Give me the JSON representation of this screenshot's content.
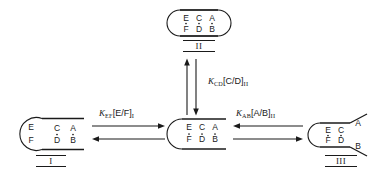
{
  "figure": {
    "type": "equilibrium-scheme",
    "background_color": "#ffffff",
    "line_color": "#1a1a1a"
  },
  "nodes": [
    {
      "id": "node-II",
      "numeral": "II",
      "left_end": "closed-round",
      "right_end": "closed-round",
      "rows": {
        "top": [
          "E",
          "C",
          "A"
        ],
        "bottom": [
          "F",
          "D",
          "B"
        ]
      },
      "pairs_bonded": [
        "E/F",
        "C/D",
        "A/B"
      ],
      "position": {
        "x": 168,
        "y": 8
      }
    },
    {
      "id": "node-center",
      "numeral": "",
      "left_end": "closed-round",
      "right_end": "open-flat",
      "rows": {
        "top": [
          "E",
          "C",
          "A"
        ],
        "bottom": [
          "F",
          "D",
          "B"
        ]
      },
      "pairs_bonded": [
        "E/F",
        "C/D",
        "A/B"
      ],
      "position": {
        "x": 168,
        "y": 117
      }
    },
    {
      "id": "node-I",
      "numeral": "I",
      "left_end": "open-bulb",
      "right_end": "open-flat",
      "rows": {
        "top": [
          "E",
          "C",
          "A"
        ],
        "bottom": [
          "F",
          "D",
          "B"
        ]
      },
      "pairs_bonded": [
        "C/D",
        "A/B"
      ],
      "position": {
        "x": 16,
        "y": 117
      }
    },
    {
      "id": "node-III",
      "numeral": "III",
      "left_end": "closed-round",
      "right_end": "splayed",
      "rows": {
        "top": [
          "E",
          "C",
          "A"
        ],
        "bottom": [
          "F",
          "D",
          "B"
        ]
      },
      "pairs_bonded": [
        "E/F",
        "C/D"
      ],
      "position": {
        "x": 306,
        "y": 117
      }
    }
  ],
  "equilibria": [
    {
      "id": "eq-EF",
      "constant": "K",
      "constant_sub": "EF",
      "bracket": "[E/F]",
      "state_sub": "I",
      "full_label": "KEF[E/F]I",
      "orientation": "horizontal",
      "forward_direction": "right",
      "between": [
        "node-I",
        "node-center"
      ],
      "label_position": {
        "x": 99,
        "y": 108
      }
    },
    {
      "id": "eq-CD",
      "constant": "K",
      "constant_sub": "CD",
      "bracket": "[C/D]",
      "state_sub": "II",
      "full_label": "KCD[C/D]II",
      "orientation": "vertical",
      "forward_direction": "down",
      "between": [
        "node-II",
        "node-center"
      ],
      "label_position": {
        "x": 208,
        "y": 76
      }
    },
    {
      "id": "eq-AB",
      "constant": "K",
      "constant_sub": "AB",
      "bracket": "[A/B]",
      "state_sub": "II",
      "full_label": "KAB[A/B]II",
      "orientation": "horizontal",
      "forward_direction": "left",
      "between": [
        "node-III",
        "node-center"
      ],
      "label_position": {
        "x": 236,
        "y": 108
      }
    }
  ]
}
